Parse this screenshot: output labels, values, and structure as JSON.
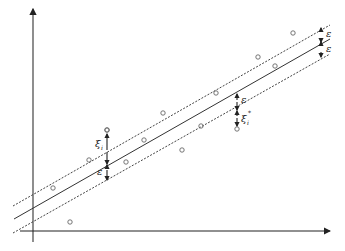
{
  "diagram": {
    "title": "",
    "type": "svr-epsilon-tube",
    "labels": {
      "epsilon": "ε",
      "xi_i": "ξ",
      "xi_i_sub": "i",
      "xi_star": "ξ",
      "xi_star_sup": "*",
      "xi_star_sub": "i"
    },
    "axes": {
      "x_axis": {
        "from": [
          20,
          231
        ],
        "to": [
          330,
          231
        ]
      },
      "y_axis": {
        "from": [
          33,
          242
        ],
        "to": [
          33,
          8
        ]
      }
    },
    "lines": {
      "upper_dashed": {
        "from": [
          13,
          206
        ],
        "to": [
          330,
          25
        ]
      },
      "center_solid": {
        "from": [
          14,
          219
        ],
        "to": [
          330,
          39
        ]
      },
      "lower_dashed": {
        "from": [
          13,
          233
        ],
        "to": [
          330,
          54
        ]
      }
    },
    "points": [
      [
        293,
        33
      ],
      [
        258,
        57
      ],
      [
        275,
        66
      ],
      [
        216,
        93
      ],
      [
        243,
        102
      ],
      [
        163,
        113
      ],
      [
        201,
        126
      ],
      [
        118,
        140
      ],
      [
        144,
        146
      ],
      [
        182,
        150
      ],
      [
        89,
        160
      ],
      [
        107,
        182
      ],
      [
        53,
        188
      ],
      [
        70,
        222
      ],
      [
        107,
        130
      ],
      [
        237,
        129
      ]
    ],
    "colors": {
      "line": "#333333",
      "dashed": "#444444",
      "point": "#666666"
    }
  }
}
